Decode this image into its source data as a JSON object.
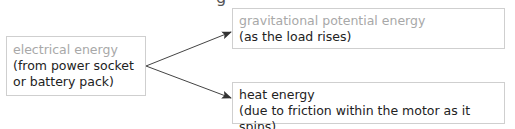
{
  "diagram": {
    "top_clip_glyph": "g",
    "source": {
      "title": "electrical energy",
      "line1": "(from power socket",
      "line2": "or battery pack)"
    },
    "outputs": [
      {
        "title": "gravitational potential energy",
        "line1": "(as the load rises)"
      },
      {
        "title": "heat energy",
        "line1": "(due to friction within the motor as it spins)"
      }
    ],
    "colors": {
      "title_light": "#a8a8a8",
      "text": "#222222",
      "border": "#cfcfcf",
      "arrow": "#333333"
    }
  }
}
